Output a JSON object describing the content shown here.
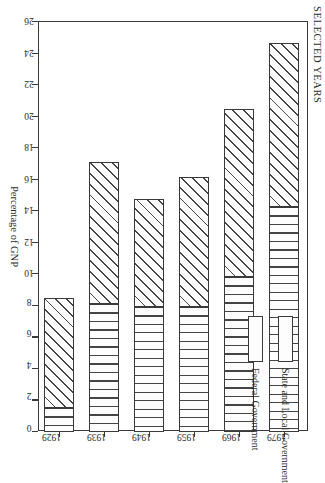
{
  "chart": {
    "title": "SELECTED YEARS",
    "value_axis_title": "Percentage of GNP"
  },
  "legend": {
    "entries": [
      {
        "label": "State and Local Government",
        "pattern": "diagonal-hatch"
      },
      {
        "label": "Federal Government",
        "pattern": "vertical-lines"
      }
    ]
  },
  "chart_data": {
    "type": "bar",
    "orientation": "horizontal",
    "stacked": true,
    "title": "SELECTED YEARS",
    "xlabel": "Percentage of GNP",
    "ylabel": "",
    "categories": [
      "1929",
      "1939",
      "1949",
      "1959",
      "1969",
      "1979"
    ],
    "series": [
      {
        "name": "Federal Government",
        "values": [
          1.5,
          8.1,
          7.9,
          7.9,
          9.8,
          14.3
        ]
      },
      {
        "name": "State and Local Government",
        "values": [
          7.0,
          9.0,
          6.9,
          8.3,
          10.7,
          10.4
        ]
      }
    ],
    "totals": [
      8.5,
      17.1,
      14.8,
      16.2,
      20.5,
      24.7
    ],
    "xlim": [
      0,
      26
    ],
    "xticks": [
      0,
      2,
      4,
      6,
      8,
      10,
      12,
      14,
      16,
      18,
      20,
      22,
      24,
      26
    ],
    "xtick_labels": [
      "0",
      "2",
      "4",
      "6",
      "8",
      "10",
      "12",
      "14",
      "16",
      "18",
      "20",
      "22",
      "24",
      "26"
    ],
    "grid": false,
    "legend_position": "inside-left"
  }
}
